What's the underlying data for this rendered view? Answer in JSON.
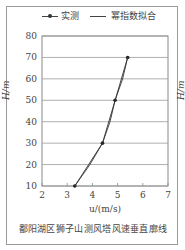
{
  "chart_data": {
    "type": "line",
    "title": "鄱阳湖区狮子山测风塔风速垂直廓线",
    "xlabel": "u/(m/s)",
    "ylabel": "H/m",
    "xlim": [
      2,
      7
    ],
    "ylim": [
      10,
      80
    ],
    "xticks": [
      2,
      3,
      4,
      5,
      6,
      7
    ],
    "yticks": [
      10,
      20,
      30,
      40,
      50,
      60,
      70,
      80
    ],
    "grid": "horizontal",
    "legend_position": "top",
    "series": [
      {
        "name": "实测",
        "style": "line-with-markers",
        "x": [
          3.3,
          4.4,
          4.9,
          5.4
        ],
        "y": [
          10,
          30,
          50,
          70
        ]
      },
      {
        "name": "幂指数拟合",
        "style": "line",
        "x": [
          3.3,
          3.9,
          4.4,
          4.7,
          4.9,
          5.2,
          5.4
        ],
        "y": [
          10,
          20,
          30,
          40,
          50,
          60,
          70
        ]
      }
    ]
  },
  "legend": {
    "measured": "实测",
    "fit": "幂指数拟合"
  },
  "axes": {
    "ylabel": "H/m",
    "xlabel": "u/(m/s)",
    "right_partial_label": "H/m",
    "xticks": [
      "2",
      "3",
      "4",
      "5",
      "6",
      "7"
    ],
    "yticks": [
      "80",
      "70",
      "60",
      "50",
      "40",
      "30",
      "20",
      "10"
    ]
  },
  "caption": "鄱阳湖区狮子山测风塔风速垂直廓线"
}
